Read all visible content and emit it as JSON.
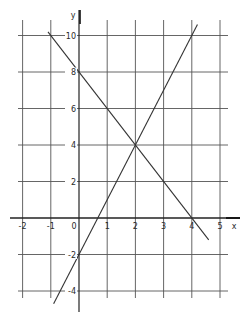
{
  "chart_data": {
    "type": "line",
    "title": "",
    "xlabel": "x",
    "ylabel": "y",
    "xlim": [
      -2.3,
      5.3
    ],
    "ylim": [
      -5,
      11
    ],
    "grid": true,
    "x_ticks": [
      -2,
      -1,
      0,
      1,
      2,
      3,
      4,
      5
    ],
    "y_ticks": [
      -4,
      -2,
      2,
      4,
      6,
      8,
      10
    ],
    "x_tick_labels": [
      "-2",
      "-1",
      "0",
      "1",
      "2",
      "3",
      "4",
      "5"
    ],
    "y_tick_labels": [
      "-4",
      "-2",
      "2",
      "4",
      "6",
      "8",
      "10"
    ],
    "series": [
      {
        "name": "y = 3x - 2",
        "slope": 3,
        "intercept": -2,
        "x": [
          -0.9,
          4.2
        ],
        "y": [
          -4.7,
          10.6
        ]
      },
      {
        "name": "y = -2x + 8",
        "slope": -2,
        "intercept": 8,
        "x": [
          -1.1,
          4.6
        ],
        "y": [
          10.2,
          -1.2
        ]
      }
    ],
    "annotations": [
      {
        "text": "intersection",
        "x": 2,
        "y": 4
      }
    ],
    "legend": "none",
    "line_color": "#333333"
  }
}
